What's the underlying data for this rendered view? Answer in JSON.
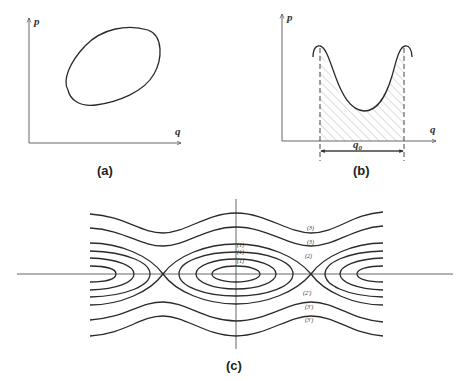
{
  "figure": {
    "panel_a": {
      "caption": "(a)",
      "x_axis_label": "q",
      "y_axis_label": "p",
      "description": "closed tilted oval orbit in phase plane"
    },
    "panel_b": {
      "caption": "(b)",
      "x_axis_label": "q",
      "y_axis_label": "p",
      "interval_label": "q0",
      "interval_label_main": "q",
      "interval_label_sub": "0",
      "description": "double-hump curve with hatched area between dashed verticals"
    },
    "panel_c": {
      "caption": "(c)",
      "curve_labels_upper": [
        "(3)",
        "(3)",
        "(2)"
      ],
      "curve_labels_center": [
        "(1)",
        "(1)",
        "(1)"
      ],
      "curve_labels_lower": [
        "(2')",
        "(3')",
        "(3')"
      ],
      "description": "pendulum-like phase portrait with closed orbits, separatrices and open trajectories"
    }
  },
  "colors": {
    "line": "#2a2a2a",
    "axis": "#555555",
    "hatch": "#9a9a9a",
    "background": "#ffffff"
  }
}
